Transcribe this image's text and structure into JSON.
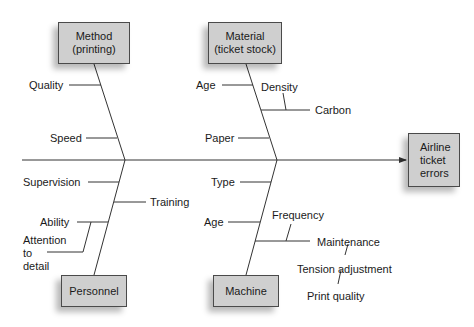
{
  "diagram": {
    "type": "fishbone",
    "effect": {
      "label_lines": [
        "Airline",
        "ticket",
        "errors"
      ]
    },
    "categories": {
      "method": {
        "title_lines": [
          "Method",
          "(printing)"
        ],
        "causes": [
          "Quality",
          "Speed"
        ]
      },
      "material": {
        "title_lines": [
          "Material",
          "(ticket stock)"
        ],
        "causes": [
          "Age",
          "Paper"
        ],
        "sub_causes": {
          "label": "Carbon",
          "sub": [
            "Density"
          ]
        }
      },
      "personnel": {
        "title_lines": [
          "Personnel"
        ],
        "causes": [
          "Supervision",
          "Training",
          "Ability"
        ],
        "sub_causes": {
          "parent": "Ability",
          "sub_lines": [
            "Attention",
            "to",
            "detail"
          ]
        }
      },
      "machine": {
        "title_lines": [
          "Machine"
        ],
        "causes": [
          "Type",
          "Age"
        ],
        "sub_causes": {
          "label": "Maintenance",
          "sub": [
            "Frequency"
          ],
          "chain": [
            "Tension adjustment",
            "Print quality"
          ]
        }
      }
    },
    "colors": {
      "box_fill": "#cfcfcf",
      "line": "#333333",
      "text": "#1a1a1a",
      "background": "#ffffff"
    }
  }
}
